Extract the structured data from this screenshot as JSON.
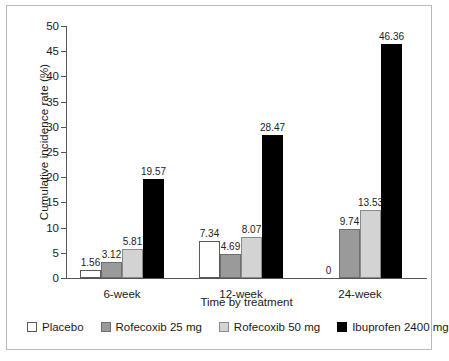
{
  "chart_data": {
    "type": "bar",
    "title": "",
    "xlabel": "Time by treatment",
    "ylabel": "Cumulative incidence rate (%)",
    "ylim": [
      0,
      50
    ],
    "ytick_step": 5,
    "yticks": [
      0,
      5,
      10,
      15,
      20,
      25,
      30,
      35,
      40,
      45,
      50
    ],
    "ytick_labels": [
      "0",
      "5",
      "10",
      "15",
      "20",
      "25",
      "30",
      "35",
      "40",
      "45",
      "50"
    ],
    "grid": false,
    "legend_position": "bottom",
    "categories": [
      "6-week",
      "12-week",
      "24-week"
    ],
    "series": [
      {
        "name": "Placebo",
        "color": "#ffffff",
        "edge_color": "#5a5a5a",
        "values": [
          1.56,
          7.34,
          0
        ],
        "value_labels": [
          "1.56",
          "7.34",
          "0"
        ]
      },
      {
        "name": "Rofecoxib 25 mg",
        "color": "#9a9a9a",
        "edge_color": "#6e6e6e",
        "values": [
          3.12,
          4.69,
          9.74
        ],
        "value_labels": [
          "3.12",
          "4.69",
          "9.74"
        ]
      },
      {
        "name": "Rofecoxib 50 mg",
        "color": "#d3d3d3",
        "edge_color": "#8a8a8a",
        "values": [
          5.81,
          8.07,
          13.53
        ],
        "value_labels": [
          "5.81",
          "8.07",
          "13.53"
        ]
      },
      {
        "name": "Ibuprofen 2400 mg",
        "color": "#000000",
        "edge_color": "#000000",
        "values": [
          19.57,
          28.47,
          46.36
        ],
        "value_labels": [
          "19.57",
          "28.47",
          "46.36"
        ]
      }
    ]
  },
  "axes": {
    "y_title": "Cumulative incidence rate (%)",
    "x_title": "Time by treatment"
  },
  "legend": {
    "items": [
      {
        "label": "Placebo",
        "swatch": "placebo"
      },
      {
        "label": "Rofecoxib 25 mg",
        "swatch": "rofe25"
      },
      {
        "label": "Rofecoxib 50 mg",
        "swatch": "rofe50"
      },
      {
        "label": "Ibuprofen 2400 mg",
        "swatch": "ibu"
      }
    ]
  }
}
